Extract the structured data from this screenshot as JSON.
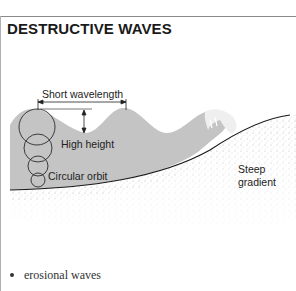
{
  "title": "DESTRUCTIVE WAVES",
  "diagram": {
    "labels": {
      "wavelength": "Short wavelength",
      "height": "High height",
      "orbit": "Circular orbit",
      "gradient_line1": "Steep",
      "gradient_line2": "gradient"
    },
    "colors": {
      "water": "#c4c4c4",
      "seabed_line": "#1a1a1a",
      "sand_dots": "#9a9a9a",
      "foam": "#f2f2f2"
    }
  },
  "bullets": [
    {
      "text": "erosional waves"
    }
  ]
}
